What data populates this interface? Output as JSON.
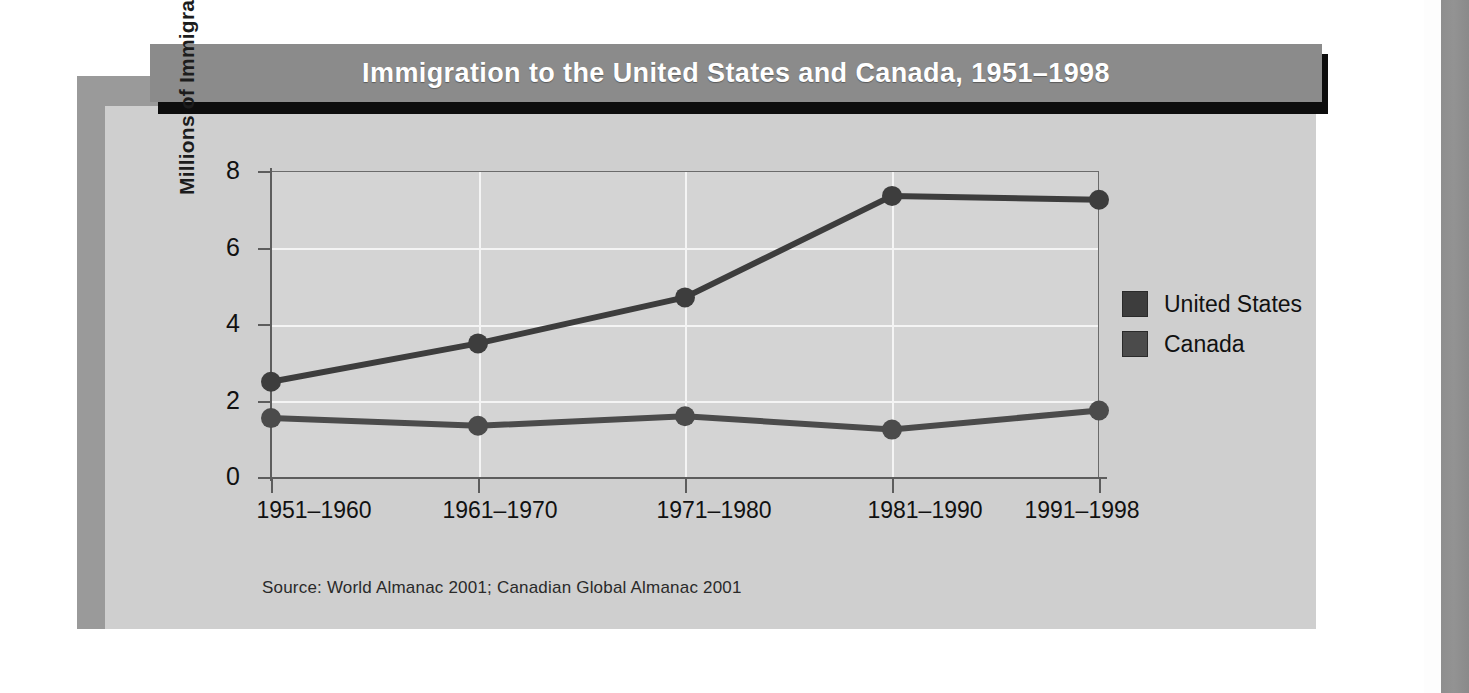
{
  "figure": {
    "title": "Immigration to the United States and Canada, 1951–1998",
    "source": "Source: World Almanac 2001; Canadian Global Almanac 2001"
  },
  "colors": {
    "title_bar_bg": "#8b8b8b",
    "title_text": "#ffffff",
    "card_bg": "#cfcfcf",
    "frame_bg": "#9a9a9a",
    "plot_bg": "#d4d4d4",
    "gridline": "#f4f4f4",
    "axis": "#5d5d5d",
    "united_states_series": "#3d3d3d",
    "canada_series": "#4b4b4b"
  },
  "chart_data": {
    "type": "line",
    "title": "Immigration to the United States and Canada, 1951–1998",
    "xlabel": "",
    "ylabel": "Millions of Immigrants",
    "categories": [
      "1951–1960",
      "1961–1970",
      "1971–1980",
      "1981–1990",
      "1991–1998"
    ],
    "yticks": [
      0,
      2,
      4,
      6,
      8
    ],
    "ylim": [
      0,
      8
    ],
    "grid": "horizontal and vertical gridlines",
    "legend_position": "right",
    "series": [
      {
        "name": "United States",
        "color": "#3d3d3d",
        "values": [
          2.5,
          3.5,
          4.7,
          7.35,
          7.25
        ]
      },
      {
        "name": "Canada",
        "color": "#4b4b4b",
        "values": [
          1.55,
          1.35,
          1.6,
          1.25,
          1.75
        ]
      }
    ],
    "source": "Source: World Almanac 2001; Canadian Global Almanac 2001"
  },
  "legend": {
    "items": [
      {
        "label": "United States",
        "color": "#3d3d3d"
      },
      {
        "label": "Canada",
        "color": "#4b4b4b"
      }
    ]
  },
  "yticklabels": [
    "8",
    "6",
    "4",
    "2",
    "0"
  ]
}
